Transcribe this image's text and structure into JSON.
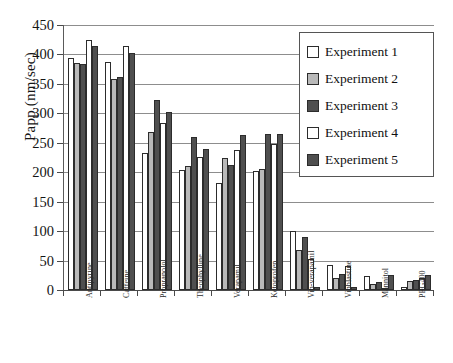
{
  "chart_data": {
    "type": "bar",
    "title": "",
    "xlabel": "",
    "ylabel": "Papp (nm/sec)",
    "ylim": [
      0,
      450
    ],
    "yticks": [
      0,
      50,
      100,
      150,
      200,
      250,
      300,
      350,
      400,
      450
    ],
    "ytick_labels": [
      "0",
      "50",
      "100",
      "150",
      "200",
      "250",
      "300",
      "350",
      "400",
      "450"
    ],
    "grid": true,
    "legend_position": "top-right",
    "categories": [
      "Antipyrine",
      "Caffeine",
      "Propranolol",
      "Theophylline",
      "Verapamil",
      "Ketoprofen",
      "Vin-verapamil",
      "Vinblastine",
      "Mannitol",
      "PEG400"
    ],
    "series": [
      {
        "name": "Experiment 1",
        "color": "#ffffff",
        "values": [
          394,
          387,
          232,
          203,
          182,
          202,
          101,
          43,
          24,
          5
        ]
      },
      {
        "name": "Experiment 2",
        "color": "#b9b9b9",
        "values": [
          385,
          358,
          268,
          210,
          224,
          205,
          68,
          21,
          10,
          15
        ]
      },
      {
        "name": "Experiment 3",
        "color": "#4f4f4f",
        "values": [
          383,
          361,
          323,
          260,
          213,
          265,
          90,
          27,
          14,
          17
        ]
      },
      {
        "name": "Experiment 4",
        "color": "#ffffff",
        "values": [
          424,
          414,
          284,
          226,
          238,
          248,
          52,
          41,
          4,
          20
        ]
      },
      {
        "name": "Experiment 5",
        "color": "#4f4f4f",
        "values": [
          414,
          403,
          303,
          239,
          264,
          265,
          5,
          5,
          26,
          26
        ]
      }
    ]
  },
  "legend": {
    "items": [
      {
        "label": "Experiment 1",
        "swatch": "#ffffff"
      },
      {
        "label": "Experiment 2",
        "swatch": "#b9b9b9"
      },
      {
        "label": "Experiment 3",
        "swatch": "#4f4f4f"
      },
      {
        "label": "Experiment 4",
        "swatch": "#ffffff"
      },
      {
        "label": "Experiment 5",
        "swatch": "#4f4f4f"
      }
    ]
  }
}
